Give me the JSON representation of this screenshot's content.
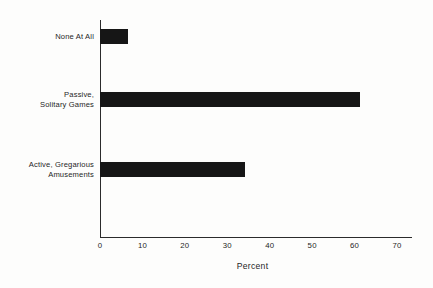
{
  "chart_data": {
    "type": "bar",
    "orientation": "horizontal",
    "title": "",
    "xlabel": "Percent",
    "ylabel": "",
    "categories": [
      "None At All",
      "Passive,\nSolitary Games",
      "Active, Gregarious\nAmusements"
    ],
    "values": [
      6.7,
      61.3,
      34.2
    ],
    "xlim": [
      0,
      70
    ],
    "xticks": [
      0,
      10,
      20,
      30,
      40,
      50,
      60,
      70
    ],
    "xticklabels": [
      "0",
      "10",
      "20",
      "30",
      "40",
      "50",
      "60",
      "70"
    ],
    "grid": false,
    "legend": null,
    "bar_color": "#161616",
    "axis_color": "#2b2b2b",
    "background": "#fdfdfc"
  }
}
